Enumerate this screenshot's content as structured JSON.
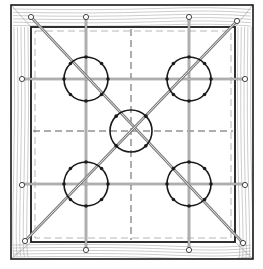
{
  "diagram": {
    "colors": {
      "background": "#ffffff",
      "frame_outline": "#1a1a1a",
      "wood_grain": "#9a9a9a",
      "rod": "#7a7a7a",
      "rod_core": "#ffffff",
      "hoop": "#1a1a1a",
      "dashed_guide": "#333333",
      "knob_fill": "#ffffff"
    },
    "outer_frame": {
      "x": 11,
      "y": 5,
      "w": 242,
      "h": 254
    },
    "inner_opening": {
      "x": 31,
      "y": 27,
      "w": 204,
      "h": 215
    },
    "guides": {
      "vertical_x": 131,
      "horizontal_y": 131
    },
    "rods": {
      "vertical": [
        86,
        189
      ],
      "horizontal": [
        79,
        184
      ],
      "diagonals": [
        {
          "x1": 31,
          "y1": 17,
          "x2": 235,
          "y2": 242
        },
        {
          "x1": 106,
          "y1": 21,
          "x2": 25,
          "y2": 241
        }
      ]
    },
    "hoops": [
      {
        "id": "top-left",
        "cx": 86,
        "cy": 79,
        "r": 22
      },
      {
        "id": "top-right",
        "cx": 189,
        "cy": 79,
        "r": 22
      },
      {
        "id": "center",
        "cx": 131,
        "cy": 131,
        "r": 21
      },
      {
        "id": "bottom-left",
        "cx": 86,
        "cy": 184,
        "r": 22
      },
      {
        "id": "bottom-right",
        "cx": 189,
        "cy": 184,
        "r": 22
      }
    ],
    "knobs": [
      {
        "cx": 31,
        "cy": 17
      },
      {
        "cx": 86,
        "cy": 17
      },
      {
        "cx": 189,
        "cy": 17
      },
      {
        "cx": 237,
        "cy": 21
      },
      {
        "cx": 22,
        "cy": 79
      },
      {
        "cx": 245,
        "cy": 79
      },
      {
        "cx": 22,
        "cy": 185
      },
      {
        "cx": 245,
        "cy": 185
      },
      {
        "cx": 25,
        "cy": 241
      },
      {
        "cx": 86,
        "cy": 250
      },
      {
        "cx": 189,
        "cy": 250
      },
      {
        "cx": 243,
        "cy": 243
      }
    ]
  }
}
